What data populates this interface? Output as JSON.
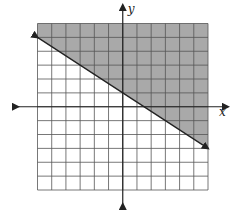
{
  "chart_data": {
    "type": "line",
    "title": "",
    "xlabel": "x",
    "ylabel": "y",
    "xlim": [
      -6,
      6
    ],
    "ylim": [
      -6,
      6
    ],
    "grid": true,
    "grid_step": 1,
    "series": [
      {
        "name": "boundary line",
        "equation": "y = -2/3 x + 1",
        "style": "solid",
        "arrows": "both",
        "points": [
          [
            -6,
            5
          ],
          [
            0,
            1
          ],
          [
            6,
            -3
          ]
        ]
      }
    ],
    "shaded_region": "above line (y >= -2/3 x + 1)",
    "shade_color": "#9a9a9a"
  },
  "axes": {
    "x_label": "x",
    "y_label": "y"
  }
}
